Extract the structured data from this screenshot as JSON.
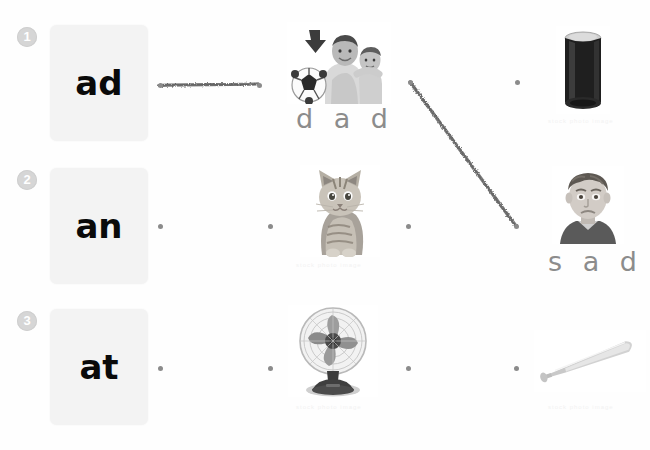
{
  "worksheet": {
    "title": "Word Family Matching Worksheet",
    "background_color": "#fefefe",
    "dot_color": "#8b8b8b",
    "pencil_color": "#6b6b6b",
    "badge_color": "#d6d6d6",
    "card_color": "#f3f3f3"
  },
  "rows": [
    {
      "number": "1",
      "card_word": "ad",
      "picture_left": "dad-and-child-photo",
      "picture_right": "soda-can-photo",
      "traced_word_left": "d a d",
      "traced_word_right": "",
      "drawn_line": "horizontal-line-card-to-dad"
    },
    {
      "number": "2",
      "card_word": "an",
      "picture_left": "kitten-cat-photo",
      "picture_right": "sad-boy-face-photo",
      "traced_word_left": "",
      "traced_word_right": "s a d",
      "drawn_line": "diagonal-line-dad-dot-to-sad-dot"
    },
    {
      "number": "3",
      "card_word": "at",
      "picture_left": "electric-fan-photo",
      "picture_right": "baseball-bat-photo",
      "traced_word_left": "",
      "traced_word_right": "",
      "drawn_line": ""
    }
  ],
  "dots": {
    "row1": [
      "card-dot",
      "picture-left-dot",
      "picture-right-dot"
    ],
    "row2": [
      "card-dot",
      "picture-left-dot",
      "picture-right-dot",
      "far-right-dot"
    ],
    "row3": [
      "card-dot",
      "picture-left-dot",
      "picture-right-dot",
      "far-right-dot"
    ]
  },
  "watermarks": {
    "caption_1": "stock photo image",
    "caption_2": "stock photo image",
    "caption_3": "stock photo image",
    "caption_4": "stock photo image"
  }
}
